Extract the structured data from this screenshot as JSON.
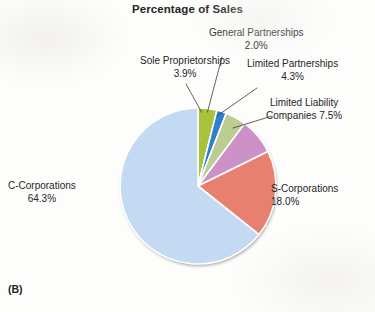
{
  "figure": {
    "title": "Percentage of Sales",
    "panel_label": "(B)",
    "background_color": "#fdfdfc",
    "text_color": "#262524"
  },
  "annotations": {
    "sole_proprietorships": {
      "name": "Sole Proprietorships",
      "percent": "3.9%"
    },
    "general_partnerships": {
      "name": "General Partnerships",
      "percent": "2.0%"
    },
    "limited_partnerships": {
      "name": "Limited Partnerships",
      "percent": "4.3%"
    },
    "limited_liability_companies": {
      "line1": "Limited Liability",
      "line2": "Companies 7.5%"
    },
    "s_corporations": {
      "name": "S-Corporations",
      "percent": "18.0%"
    },
    "c_corporations": {
      "name": "C-Corporations",
      "percent": "64.3%"
    }
  },
  "chart_data": {
    "type": "pie",
    "title": "Percentage of Sales",
    "xlabel": "",
    "ylabel": "",
    "units": "percent",
    "total": 100.0,
    "start_angle_deg": 0,
    "direction": "clockwise",
    "legend": "none",
    "grid": false,
    "labels_inline": true,
    "categories": [
      "Sole Proprietorships",
      "General Partnerships",
      "Limited Partnerships",
      "Limited Liability Companies",
      "S-Corporations",
      "C-Corporations"
    ],
    "values": [
      3.9,
      2.0,
      4.3,
      7.5,
      18.0,
      64.3
    ],
    "colors": [
      "#a8c23a",
      "#2f7fd0",
      "#bccd92",
      "#cc92c8",
      "#e8806f",
      "#c3daf2"
    ],
    "slices": [
      {
        "label": "Sole Proprietorships",
        "value": 3.9,
        "display": "3.9%",
        "color": "#a8c23a"
      },
      {
        "label": "General Partnerships",
        "value": 2.0,
        "display": "2.0%",
        "color": "#2f7fd0"
      },
      {
        "label": "Limited Partnerships",
        "value": 4.3,
        "display": "4.3%",
        "color": "#bccd92"
      },
      {
        "label": "Limited Liability Companies",
        "value": 7.5,
        "display": "7.5%",
        "color": "#cc92c8"
      },
      {
        "label": "S-Corporations",
        "value": 18.0,
        "display": "18.0%",
        "color": "#e8806f"
      },
      {
        "label": "C-Corporations",
        "value": 64.3,
        "display": "64.3%",
        "color": "#c3daf2"
      }
    ]
  }
}
